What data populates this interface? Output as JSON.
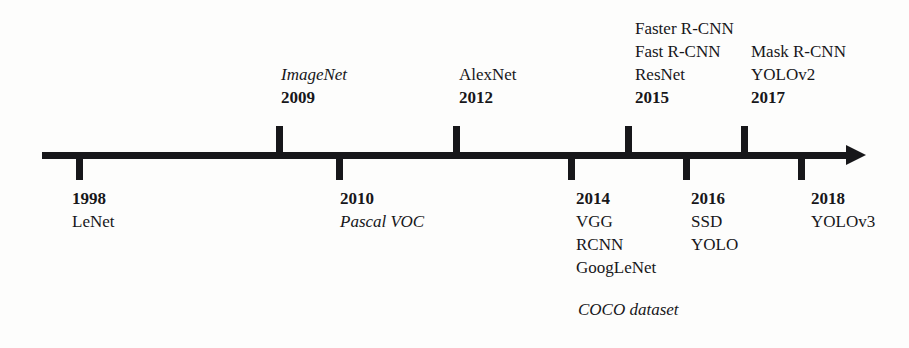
{
  "diagram": {
    "type": "horizontal-timeline",
    "axis": {
      "orientation": "left-to-right",
      "arrow_direction": "right",
      "color": "#17171a"
    },
    "events_above_line": [
      {
        "year": "2009",
        "names": [
          "ImageNet"
        ],
        "italic_names": [
          "ImageNet"
        ],
        "tick_x": 278
      },
      {
        "year": "2012",
        "names": [
          "AlexNet"
        ],
        "italic_names": [],
        "tick_x": 455
      },
      {
        "year": "2015",
        "names": [
          "Faster R-CNN",
          "Fast R-CNN",
          "ResNet"
        ],
        "italic_names": [],
        "tick_x": 627
      },
      {
        "year": "2017",
        "names": [
          "Mask R-CNN",
          "YOLOv2"
        ],
        "italic_names": [],
        "tick_x": 743
      }
    ],
    "events_below_line": [
      {
        "year": "1998",
        "names": [
          "LeNet"
        ],
        "italic_names": [],
        "tick_x": 78
      },
      {
        "year": "2010",
        "names": [
          "Pascal VOC"
        ],
        "italic_names": [
          "Pascal VOC"
        ],
        "tick_x": 338
      },
      {
        "year": "2014",
        "names": [
          "VGG",
          "RCNN",
          "GoogLeNet"
        ],
        "italic_names": [],
        "tick_x": 570
      },
      {
        "year": "2016",
        "names": [
          "SSD",
          "YOLO"
        ],
        "italic_names": [],
        "tick_x": 685
      },
      {
        "year": "2018",
        "names": [
          "YOLOv3"
        ],
        "italic_names": [],
        "tick_x": 800
      }
    ],
    "standalone_notes": [
      {
        "text": "COCO dataset",
        "style": "italic"
      }
    ]
  },
  "labels": {
    "e2009": {
      "name": "ImageNet",
      "year": "2009"
    },
    "e2012": {
      "name": "AlexNet",
      "year": "2012"
    },
    "e2015": {
      "n1": "Faster R-CNN",
      "n2": "Fast R-CNN",
      "n3": "ResNet",
      "year": "2015"
    },
    "e2017": {
      "n1": "Mask R-CNN",
      "n2": "YOLOv2",
      "year": "2017"
    },
    "e1998": {
      "year": "1998",
      "name": "LeNet"
    },
    "e2010": {
      "year": "2010",
      "name": "Pascal VOC"
    },
    "e2014": {
      "year": "2014",
      "n1": "VGG",
      "n2": "RCNN",
      "n3": "GoogLeNet"
    },
    "e2016": {
      "year": "2016",
      "n1": "SSD",
      "n2": "YOLO"
    },
    "e2018": {
      "year": "2018",
      "name": "YOLOv3"
    },
    "coco": "COCO dataset"
  }
}
